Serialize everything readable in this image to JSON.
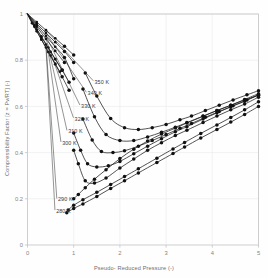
{
  "figure": {
    "background_color": "#fefefe",
    "frame_color": "#c9c9c9",
    "grid_color": "#ececec",
    "curve_color": "#1a1a1a",
    "marker_color": "#111111",
    "label_color": "#6e6e6e"
  },
  "axes": {
    "xlabel": "Pseudo- Reduced Pressure (-)",
    "ylabel": "Compressibility Factor [z = Pv/RT] (-)",
    "xticks": [
      "0",
      "1",
      "2",
      "3",
      "4",
      "5"
    ],
    "yticks": [
      "0",
      "0.2",
      "0.4",
      "0.6",
      "0.8",
      "1"
    ]
  },
  "chart_data": {
    "type": "line",
    "title": "",
    "subtitle": "",
    "xlabel": "Pseudo- Reduced Pressure (-)",
    "ylabel": "Compressibility Factor [z = Pv/RT] (-)",
    "xlim": [
      0,
      5
    ],
    "ylim": [
      0,
      1
    ],
    "xticks": [
      0,
      1,
      2,
      3,
      4,
      5
    ],
    "yticks": [
      0,
      0.2,
      0.4,
      0.6,
      0.8,
      1
    ],
    "grid": true,
    "legend": "inline-annotations",
    "markers": "filled-circle",
    "series": [
      {
        "name": "280 K",
        "label": "280 K",
        "label_x": 0.62,
        "label_y": 0.145,
        "x": [
          0.0,
          0.1,
          0.2,
          0.3,
          0.4,
          0.5,
          0.6,
          0.7,
          0.85,
          1.0,
          1.2,
          1.5,
          1.8,
          2.1,
          2.4,
          2.8,
          3.15,
          3.4,
          3.75,
          4.1,
          4.4,
          4.7,
          5.0
        ],
        "y": [
          1.0,
          0.96,
          0.925,
          0.89,
          0.855,
          0.82,
          0.785,
          0.75,
          0.14,
          0.158,
          0.178,
          0.21,
          0.245,
          0.278,
          0.312,
          0.357,
          0.396,
          0.424,
          0.463,
          0.5,
          0.532,
          0.565,
          0.6
        ],
        "break_after_index": 7
      },
      {
        "name": "290 K",
        "label": "290 K",
        "label_x": 0.66,
        "label_y": 0.195,
        "x": [
          0.0,
          0.1,
          0.2,
          0.3,
          0.4,
          0.5,
          0.6,
          0.75,
          0.88,
          1.0,
          1.2,
          1.5,
          1.8,
          2.1,
          2.4,
          2.8,
          3.15,
          3.4,
          3.75,
          4.1,
          4.4,
          4.7,
          5.0
        ],
        "y": [
          1.0,
          0.962,
          0.932,
          0.9,
          0.868,
          0.836,
          0.805,
          0.758,
          0.152,
          0.172,
          0.196,
          0.228,
          0.262,
          0.296,
          0.33,
          0.376,
          0.416,
          0.444,
          0.483,
          0.52,
          0.552,
          0.585,
          0.62
        ],
        "break_after_index": 7
      },
      {
        "name": "300 K",
        "label": "300 K",
        "label_x": 0.75,
        "label_y": 0.44,
        "x": [
          0.0,
          0.15,
          0.3,
          0.45,
          0.6,
          0.75,
          0.9,
          1.0,
          1.1,
          1.25,
          1.45,
          1.7,
          2.0,
          2.3,
          2.6,
          2.9,
          3.2,
          3.45,
          3.8,
          4.1,
          4.4,
          4.7,
          5.0
        ],
        "y": [
          1.0,
          0.945,
          0.89,
          0.835,
          0.782,
          0.728,
          0.67,
          0.2,
          0.219,
          0.248,
          0.285,
          0.326,
          0.374,
          0.415,
          0.45,
          0.48,
          0.506,
          0.528,
          0.557,
          0.582,
          0.605,
          0.628,
          0.648
        ],
        "break_after_index": 6
      },
      {
        "name": "310 K",
        "label": "310 K",
        "label_x": 0.88,
        "label_y": 0.49,
        "x": [
          0.0,
          0.15,
          0.3,
          0.45,
          0.6,
          0.75,
          0.9,
          1.0,
          1.1,
          1.25,
          1.45,
          1.7,
          2.0,
          2.3,
          2.6,
          2.9,
          3.2,
          3.45,
          3.8,
          4.1,
          4.4,
          4.7,
          5.0
        ],
        "y": [
          1.0,
          0.952,
          0.903,
          0.855,
          0.805,
          0.756,
          0.705,
          0.41,
          0.352,
          0.278,
          0.268,
          0.29,
          0.333,
          0.372,
          0.41,
          0.443,
          0.474,
          0.497,
          0.53,
          0.558,
          0.585,
          0.61,
          0.64
        ],
        "break_after_index": 6
      },
      {
        "name": "320 K",
        "label": "320 K",
        "label_x": 1.02,
        "label_y": 0.545,
        "x": [
          0.0,
          0.2,
          0.4,
          0.6,
          0.8,
          1.0,
          1.15,
          1.3,
          1.5,
          1.75,
          2.0,
          2.3,
          2.6,
          2.9,
          3.2,
          3.45,
          3.8,
          4.1,
          4.4,
          4.7,
          5.0
        ],
        "y": [
          1.0,
          0.945,
          0.892,
          0.84,
          0.79,
          0.485,
          0.41,
          0.352,
          0.338,
          0.343,
          0.362,
          0.395,
          0.428,
          0.46,
          0.49,
          0.512,
          0.545,
          0.572,
          0.598,
          0.622,
          0.65
        ],
        "break_after_index": 4
      },
      {
        "name": "330 K",
        "label": "330 K",
        "label_x": 1.16,
        "label_y": 0.6,
        "x": [
          0.0,
          0.2,
          0.4,
          0.6,
          0.8,
          1.0,
          1.2,
          1.4,
          1.6,
          1.85,
          2.1,
          2.4,
          2.7,
          3.0,
          3.3,
          3.55,
          3.85,
          4.15,
          4.45,
          4.75,
          5.0
        ],
        "y": [
          1.0,
          0.952,
          0.905,
          0.858,
          0.812,
          0.72,
          0.545,
          0.455,
          0.405,
          0.4,
          0.408,
          0.428,
          0.452,
          0.478,
          0.505,
          0.526,
          0.553,
          0.578,
          0.603,
          0.628,
          0.65
        ],
        "break_after_index": 5
      },
      {
        "name": "340 K",
        "label": "340 K",
        "label_x": 1.3,
        "label_y": 0.655,
        "x": [
          0.0,
          0.2,
          0.4,
          0.6,
          0.8,
          1.0,
          1.2,
          1.45,
          1.7,
          2.0,
          2.3,
          2.6,
          2.9,
          3.2,
          3.45,
          3.8,
          4.1,
          4.4,
          4.7,
          5.0
        ],
        "y": [
          1.0,
          0.958,
          0.918,
          0.878,
          0.838,
          0.79,
          0.675,
          0.555,
          0.478,
          0.452,
          0.452,
          0.468,
          0.488,
          0.51,
          0.53,
          0.558,
          0.582,
          0.605,
          0.63,
          0.655
        ],
        "break_after_index": 5
      },
      {
        "name": "350 K",
        "label": "350 K",
        "label_x": 1.45,
        "label_y": 0.705,
        "x": [
          0.0,
          0.2,
          0.4,
          0.6,
          0.8,
          1.0,
          1.25,
          1.5,
          1.8,
          2.1,
          2.4,
          2.7,
          3.0,
          3.3,
          3.55,
          3.85,
          4.15,
          4.45,
          4.75,
          5.0
        ],
        "y": [
          1.0,
          0.965,
          0.93,
          0.895,
          0.86,
          0.822,
          0.745,
          0.645,
          0.548,
          0.508,
          0.5,
          0.508,
          0.522,
          0.542,
          0.558,
          0.582,
          0.605,
          0.628,
          0.65,
          0.668
        ],
        "break_after_index": 5
      }
    ],
    "annotations": [
      {
        "text": "350 K",
        "x": 1.45,
        "y": 0.705
      },
      {
        "text": "340 K",
        "x": 1.3,
        "y": 0.655
      },
      {
        "text": "330 K",
        "x": 1.16,
        "y": 0.6
      },
      {
        "text": "320 K",
        "x": 1.02,
        "y": 0.545
      },
      {
        "text": "310 K",
        "x": 0.88,
        "y": 0.49
      },
      {
        "text": "300 K",
        "x": 0.75,
        "y": 0.44
      },
      {
        "text": "290 K",
        "x": 0.66,
        "y": 0.195
      },
      {
        "text": "280 K",
        "x": 0.62,
        "y": 0.145
      }
    ]
  }
}
